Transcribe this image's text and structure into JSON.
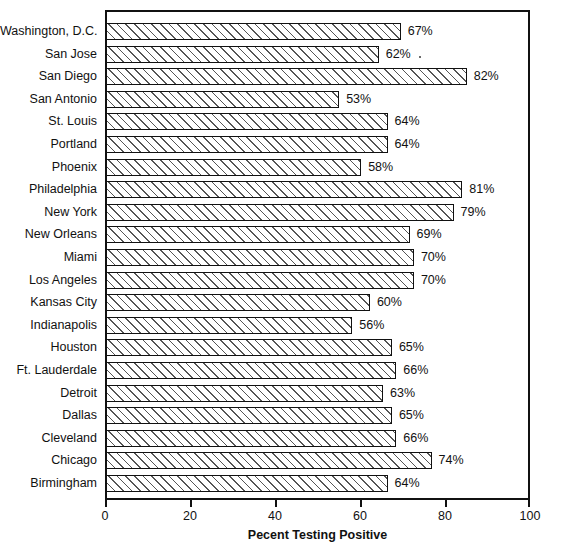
{
  "chart_data": {
    "type": "bar",
    "orientation": "horizontal",
    "title": "",
    "xlabel": "Pecent Testing Positive",
    "ylabel": "",
    "xlim": [
      0,
      100
    ],
    "xticks": [
      0,
      20,
      40,
      60,
      80,
      100
    ],
    "xtick_labels": [
      "0",
      "20",
      "40",
      "60",
      "80",
      "100"
    ],
    "grid": false,
    "legend": false,
    "value_label_suffix": "%",
    "categories": [
      "Washington, D.C.",
      "San Jose",
      "San Diego",
      "San Antonio",
      "St. Louis",
      "Portland",
      "Phoenix",
      "Philadelphia",
      "New York",
      "New Orleans",
      "Miami",
      "Los Angeles",
      "Kansas City",
      "Indianapolis",
      "Houston",
      "Ft. Lauderdale",
      "Detroit",
      "Dallas",
      "Cleveland",
      "Chicago",
      "Birmingham"
    ],
    "values": [
      67,
      62,
      82,
      53,
      64,
      64,
      58,
      81,
      79,
      69,
      70,
      70,
      60,
      56,
      65,
      66,
      63,
      65,
      66,
      74,
      64
    ],
    "value_labels": [
      "67%",
      "62%",
      "82%",
      "53%",
      "64%",
      "64%",
      "58%",
      "81%",
      "79%",
      "69%",
      "70%",
      "70%",
      "60%",
      "56%",
      "65%",
      "66%",
      "63%",
      "65%",
      "66%",
      "74%",
      "64%"
    ]
  },
  "style": {
    "bar_fill": "#ffffff",
    "bar_edge": "#111111",
    "hatch_color": "#555555",
    "axis_color": "#111111",
    "background": "#ffffff"
  }
}
